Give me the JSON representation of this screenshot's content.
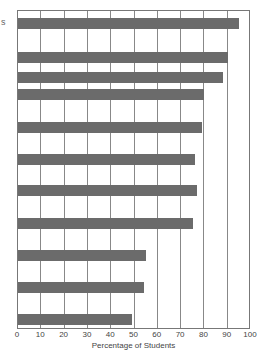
{
  "chart_data": {
    "type": "bar",
    "orientation": "horizontal",
    "title": "",
    "xlabel": "Percentage of Students",
    "ylabel": "",
    "xlim": [
      0,
      100
    ],
    "x_ticks": [
      "0",
      "10",
      "20",
      "30",
      "40",
      "50",
      "60",
      "70",
      "80",
      "90",
      "100"
    ],
    "grid": true,
    "legend": null,
    "categories": [
      "",
      "",
      "",
      "",
      "",
      "",
      "",
      "",
      "",
      "",
      ""
    ],
    "values": [
      95,
      90,
      88,
      80,
      79,
      76,
      77,
      75,
      55,
      54,
      49
    ],
    "bar_color": "#6b6b6b",
    "partial_category_label_fragment": "s"
  }
}
